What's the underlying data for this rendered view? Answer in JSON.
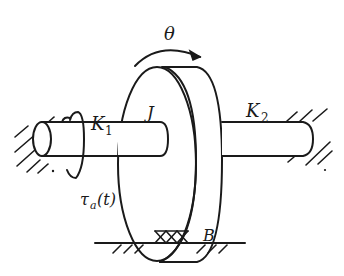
{
  "diagram": {
    "type": "mechanical-schematic",
    "labels": {
      "theta": "θ",
      "inertia": "J",
      "spring_left_main": "K",
      "spring_left_sub": "1",
      "spring_right_main": "K",
      "spring_right_sub": "2",
      "torque_main": "τ",
      "torque_sub": "a",
      "torque_arg": "(t)",
      "damper": "B"
    },
    "colors": {
      "ink": "#1a1a1a",
      "background": "#ffffff"
    }
  }
}
